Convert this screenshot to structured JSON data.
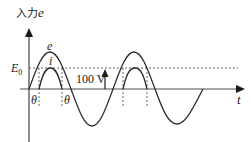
{
  "diagram": {
    "y_axis_label_prefix": "入力",
    "y_axis_label_var": "e",
    "x_axis_label": "t",
    "threshold_label_main": "E",
    "threshold_label_sub": "0",
    "curve_e_label": "e",
    "curve_i_label": "i",
    "angle_label_left": "θ",
    "angle_label_right": "θ",
    "voltage_annotation": "100 V",
    "colors": {
      "line": "#2a2a2a",
      "dashed": "#555555",
      "axis_x": "#888888"
    }
  }
}
